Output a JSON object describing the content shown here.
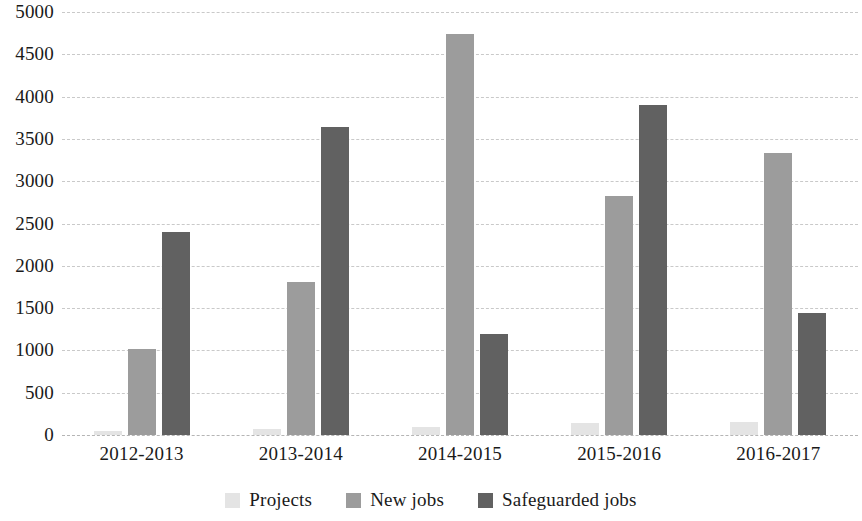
{
  "chart_data": {
    "type": "bar",
    "title": "",
    "subtitle": "",
    "xlabel": "",
    "ylabel": "",
    "categories": [
      "2012-2013",
      "2013-2014",
      "2014-2015",
      "2015-2016",
      "2016-2017"
    ],
    "series": [
      {
        "name": "Projects",
        "color": "#e4e4e4",
        "values": [
          50,
          70,
          100,
          145,
          150
        ]
      },
      {
        "name": "New jobs",
        "color": "#9c9c9c",
        "values": [
          1020,
          1810,
          4740,
          2830,
          3330
        ]
      },
      {
        "name": "Safeguarded jobs",
        "color": "#616161",
        "values": [
          2400,
          3640,
          1190,
          3900,
          1440
        ]
      }
    ],
    "ylim": [
      0,
      5000
    ],
    "ytick_step": 500,
    "yticks": [
      5000,
      4500,
      4000,
      3500,
      3000,
      2500,
      2000,
      1500,
      1000,
      500,
      0
    ],
    "ytick_labels": [
      "5000",
      "4500",
      "4000",
      "3500",
      "3000",
      "2500",
      "2000",
      "1500",
      "1000",
      "500",
      "0"
    ],
    "grid": true,
    "grid_axis": "y",
    "grid_style": "dashed",
    "grid_color": "#c9c9c9",
    "legend_position": "bottom",
    "background": "#ffffff"
  }
}
